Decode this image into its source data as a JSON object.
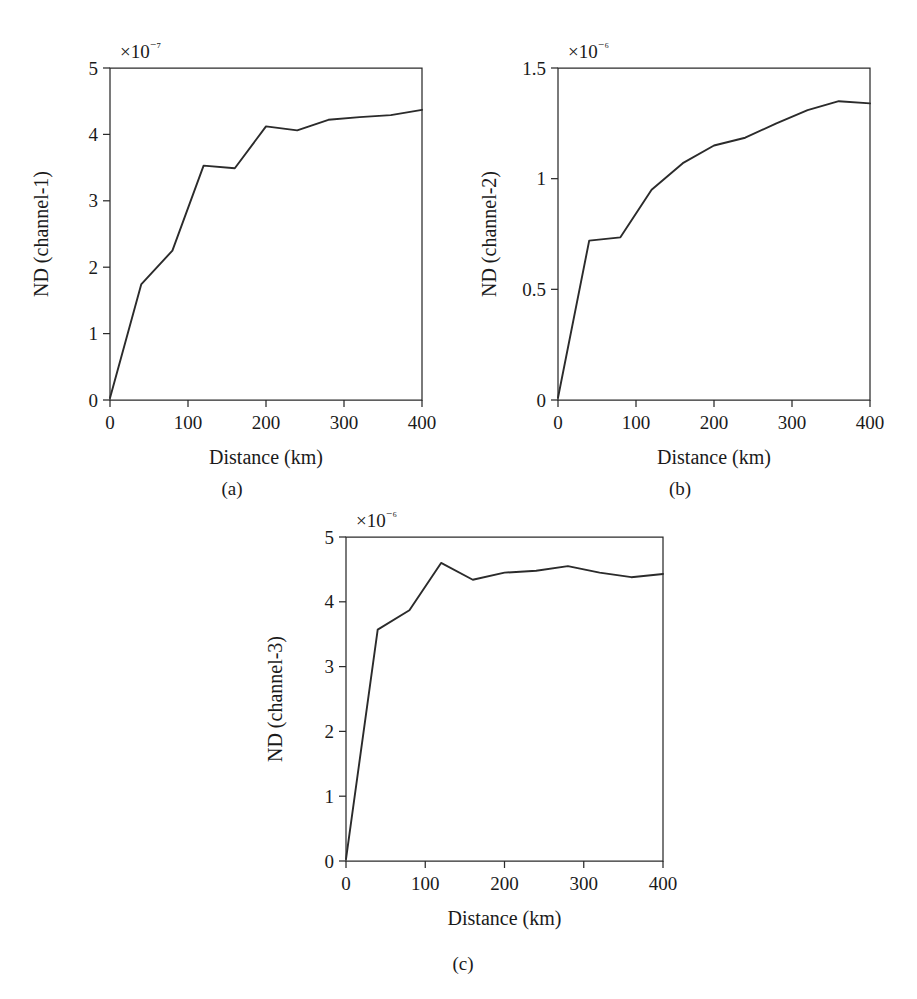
{
  "figure": {
    "panels": [
      {
        "id": "a",
        "caption": "(a)",
        "exponent_prefix": "×10",
        "exponent_power": "−7"
      },
      {
        "id": "b",
        "caption": "(b)",
        "exponent_prefix": "×10",
        "exponent_power": "−6"
      },
      {
        "id": "c",
        "caption": "(c)",
        "exponent_prefix": "×10",
        "exponent_power": "−6"
      }
    ]
  },
  "chart_data": [
    {
      "type": "line",
      "title": "",
      "panel": "(a)",
      "xlabel": "Distance (km)",
      "ylabel": "ND (channel-1)",
      "y_exponent": "×10⁻⁷",
      "xlim": [
        0,
        400
      ],
      "ylim": [
        0,
        5
      ],
      "xticks": [
        0,
        100,
        200,
        300,
        400
      ],
      "xtick_labels": [
        "0",
        "100",
        "200",
        "300",
        "400"
      ],
      "yticks": [
        0,
        1,
        2,
        3,
        4,
        5
      ],
      "ytick_labels": [
        "0",
        "1",
        "2",
        "3",
        "4",
        "5"
      ],
      "grid": false,
      "legend": false,
      "series": [
        {
          "name": "channel-1",
          "color": "#2b2b2b",
          "x": [
            0,
            40,
            80,
            120,
            160,
            200,
            240,
            280,
            320,
            360,
            400
          ],
          "y": [
            0.03,
            1.74,
            2.25,
            3.53,
            3.49,
            4.12,
            4.06,
            4.22,
            4.26,
            4.29,
            4.37
          ]
        }
      ]
    },
    {
      "type": "line",
      "title": "",
      "panel": "(b)",
      "xlabel": "Distance (km)",
      "ylabel": "ND (channel-2)",
      "y_exponent": "×10⁻⁶",
      "xlim": [
        0,
        400
      ],
      "ylim": [
        0,
        1.5
      ],
      "xticks": [
        0,
        100,
        200,
        300,
        400
      ],
      "xtick_labels": [
        "0",
        "100",
        "200",
        "300",
        "400"
      ],
      "yticks": [
        0,
        0.5,
        1,
        1.5
      ],
      "ytick_labels": [
        "0",
        "0.5",
        "1",
        "1.5"
      ],
      "grid": false,
      "legend": false,
      "series": [
        {
          "name": "channel-2",
          "color": "#2b2b2b",
          "x": [
            0,
            40,
            80,
            120,
            160,
            200,
            240,
            280,
            320,
            360,
            400
          ],
          "y": [
            0.01,
            0.72,
            0.735,
            0.95,
            1.07,
            1.15,
            1.185,
            1.25,
            1.31,
            1.35,
            1.34
          ]
        }
      ]
    },
    {
      "type": "line",
      "title": "",
      "panel": "(c)",
      "xlabel": "Distance (km)",
      "ylabel": "ND (channel-3)",
      "y_exponent": "×10⁻⁶",
      "xlim": [
        0,
        400
      ],
      "ylim": [
        0,
        5
      ],
      "xticks": [
        0,
        100,
        200,
        300,
        400
      ],
      "xtick_labels": [
        "0",
        "100",
        "200",
        "300",
        "400"
      ],
      "yticks": [
        0,
        1,
        2,
        3,
        4,
        5
      ],
      "ytick_labels": [
        "0",
        "1",
        "2",
        "3",
        "4",
        "5"
      ],
      "grid": false,
      "legend": false,
      "series": [
        {
          "name": "channel-3",
          "color": "#2b2b2b",
          "x": [
            0,
            40,
            80,
            120,
            160,
            200,
            240,
            280,
            320,
            360,
            400
          ],
          "y": [
            0.03,
            3.57,
            3.87,
            4.6,
            4.34,
            4.45,
            4.48,
            4.55,
            4.45,
            4.38,
            4.43
          ]
        }
      ]
    }
  ]
}
